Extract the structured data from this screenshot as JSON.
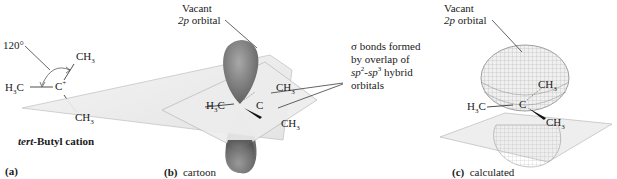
{
  "panel_a": {
    "angle_label": "120°",
    "left_group": "H3C",
    "center_atom": "C",
    "center_charge": "+",
    "top_group": "CH3",
    "bottom_group": "CH3",
    "caption_italic": "tert",
    "caption_rest": "-Butyl cation",
    "panel_label": "(a)"
  },
  "panel_b": {
    "orbital_label_line1": "Vacant",
    "orbital_label_line2_italic": "2p",
    "orbital_label_line2_rest": " orbital",
    "left_group": "H3C",
    "center_atom": "C",
    "top_group": "CH3",
    "bottom_group": "CH3",
    "panel_label": "(b)",
    "panel_caption": "cartoon"
  },
  "sigma_annotation": {
    "line1": "σ bonds formed",
    "line2": "by overlap of",
    "line3_italic_a": "sp",
    "line3_sup_a": "2",
    "line3_dash": "-",
    "line3_italic_b": "sp",
    "line3_sup_b": "3",
    "line3_rest": " hybrid",
    "line4": "orbitals"
  },
  "panel_c": {
    "orbital_label_line1": "Vacant",
    "orbital_label_line2_italic": "2p",
    "orbital_label_line2_rest": " orbital",
    "left_group": "H3C",
    "center_atom": "C",
    "top_group": "CH3",
    "bottom_group": "CH3",
    "panel_label": "(c)",
    "panel_caption": "calculated"
  },
  "colors": {
    "orbital_dark": "#6e6e6e",
    "orbital_light": "#bdbdbd",
    "plane": "#eeeeee",
    "plane_edge": "#9a9a9a",
    "mesh": "#8a8a8a",
    "text": "#1a1a1a"
  }
}
